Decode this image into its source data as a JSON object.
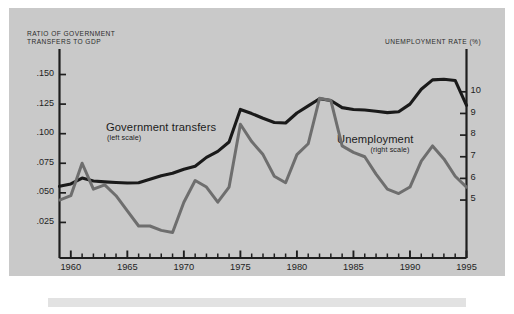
{
  "figure": {
    "background_color": "#c9c9c9",
    "page_color": "#ffffff",
    "footer_bar_color": "#e2e2e2"
  },
  "axis_titles": {
    "left": "RATIO OF GOVERNMENT\nTRANSFERS TO GDP",
    "right": "UNEMPLOYMENT RATE (%)"
  },
  "series_labels": {
    "transfers": {
      "name": "Government transfers",
      "scale_note": "(left scale)"
    },
    "unemployment": {
      "name": "Unemployment",
      "scale_note": "(right scale)"
    }
  },
  "chart_data": {
    "type": "line",
    "title": "",
    "xlabel": "",
    "ylabel": "RATIO OF GOVERNMENT TRANSFERS TO GDP",
    "y2label": "UNEMPLOYMENT RATE (%)",
    "grid": false,
    "legend": "inline-annotations",
    "xlim": [
      1959,
      1995
    ],
    "ylim": [
      0.0,
      0.1665
    ],
    "y2lim": [
      2.6,
      11.7
    ],
    "x": [
      1959,
      1960,
      1961,
      1962,
      1963,
      1964,
      1965,
      1966,
      1967,
      1968,
      1969,
      1970,
      1971,
      1972,
      1973,
      1974,
      1975,
      1976,
      1977,
      1978,
      1979,
      1980,
      1981,
      1982,
      1983,
      1984,
      1985,
      1986,
      1987,
      1988,
      1989,
      1990,
      1991,
      1992,
      1993,
      1994,
      1995
    ],
    "xticks": [
      1960,
      1965,
      1970,
      1975,
      1980,
      1985,
      1990,
      1995
    ],
    "xticklabels": [
      "1960",
      "1965",
      "1970",
      "1975",
      "1980",
      "1985",
      "1990",
      "1995"
    ],
    "yticks": [
      0.025,
      0.05,
      0.075,
      0.1,
      0.125,
      0.15
    ],
    "yticklabels": [
      ".025",
      ".050",
      ".075",
      ".100",
      ".125",
      ".150"
    ],
    "y2ticks": [
      5,
      6,
      7,
      8,
      9,
      10
    ],
    "y2ticklabels": [
      "5",
      "6",
      "7",
      "8",
      "9",
      "10"
    ],
    "series": [
      {
        "name": "Government transfers",
        "axis": "left",
        "color": "#1a1a1a",
        "line_width": 3.1,
        "values": [
          0.0555,
          0.0575,
          0.0625,
          0.06,
          0.0593,
          0.0588,
          0.0583,
          0.0585,
          0.0615,
          0.0645,
          0.0665,
          0.07,
          0.0725,
          0.08,
          0.085,
          0.093,
          0.1205,
          0.117,
          0.113,
          0.1095,
          0.109,
          0.1175,
          0.1235,
          0.1295,
          0.128,
          0.122,
          0.1205,
          0.12,
          0.119,
          0.1178,
          0.1185,
          0.125,
          0.1375,
          0.1455,
          0.146,
          0.145,
          0.124
        ]
      },
      {
        "name": "Unemployment",
        "axis": "right",
        "color": "#6e6e6e",
        "line_width": 3.0,
        "values": [
          5.0,
          5.2,
          6.7,
          5.5,
          5.7,
          5.2,
          4.5,
          3.8,
          3.8,
          3.6,
          3.5,
          4.9,
          5.9,
          5.6,
          4.9,
          5.6,
          8.5,
          7.7,
          7.1,
          6.1,
          5.8,
          7.1,
          7.6,
          9.7,
          9.6,
          7.5,
          7.2,
          7.0,
          6.2,
          5.5,
          5.3,
          5.6,
          6.8,
          7.5,
          6.9,
          6.1,
          5.6
        ]
      }
    ]
  },
  "ticks": {
    "left": [
      ".150",
      ".125",
      ".100",
      ".075",
      ".050",
      ".025"
    ],
    "right": [
      "10",
      "9",
      "8",
      "7",
      "6",
      "5"
    ],
    "bottom": [
      "1960",
      "1965",
      "1970",
      "1975",
      "1980",
      "1985",
      "1990",
      "1995"
    ]
  }
}
